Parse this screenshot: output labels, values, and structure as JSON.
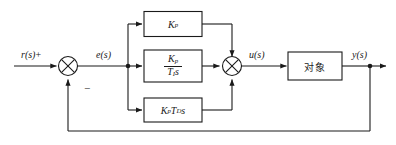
{
  "diagram": {
    "type": "control-block-diagram",
    "background_color": "#ffffff",
    "line_color": "#1a1a1a",
    "signals": {
      "reference": "r(s)",
      "reference_sign": "+",
      "error": "e(s)",
      "feedback_sign": "−",
      "control": "u(s)",
      "output": "y(s)"
    },
    "blocks": {
      "proportional": {
        "name": "proportional-gain-block",
        "label": "Kp",
        "base": "K",
        "subscript": "p"
      },
      "integral": {
        "name": "integral-block",
        "label": "Kp / TI s",
        "numerator_base": "K",
        "numerator_sub": "p",
        "denominator_base": "T",
        "denominator_sub": "I",
        "denominator_tail": "s"
      },
      "derivative": {
        "name": "derivative-block",
        "label": "Kp TD s",
        "first_base": "K",
        "first_sub": "p",
        "second_base": "T",
        "second_sub": "D",
        "tail": "s"
      },
      "plant": {
        "name": "plant-block",
        "label": "对象"
      }
    },
    "junctions": {
      "error_sum": "⊗",
      "control_sum": "⊗"
    }
  }
}
